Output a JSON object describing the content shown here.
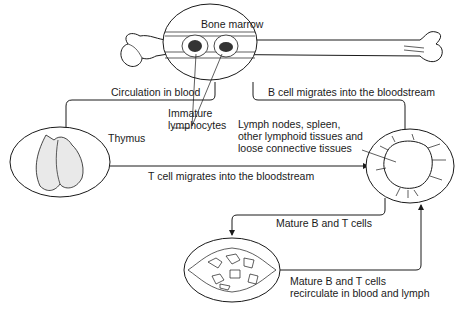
{
  "diagram": {
    "nodes": {
      "bone_marrow": {
        "label": "Bone marrow"
      },
      "thymus": {
        "label": "Thymus"
      },
      "lymph_tissues": {
        "label_lines": [
          "Lymph nodes, spleen,",
          "other lymphoid tissues and",
          "loose connective tissues"
        ]
      },
      "immature": {
        "label_lines": [
          "Immature",
          "lymphocytes"
        ]
      }
    },
    "edges": {
      "circulation": {
        "label": "Circulation in blood",
        "from": "bone_marrow",
        "to": "thymus"
      },
      "b_cell": {
        "label": "B cell migrates into the bloodstream",
        "from": "bone_marrow",
        "to": "lymph_tissues"
      },
      "t_cell": {
        "label": "T cell migrates into the bloodstream",
        "from": "thymus",
        "to": "lymph_tissues"
      },
      "mature": {
        "label": "Mature B and T cells",
        "from": "lymph_tissues",
        "to": "lymph_vessel"
      },
      "recirculate": {
        "label_lines": [
          "Mature B and T cells",
          "recirculate in blood and lymph"
        ],
        "from": "lymph_vessel",
        "to": "lymph_tissues"
      }
    },
    "colors": {
      "ink": "#1a1a1a",
      "background": "#ffffff",
      "shade": "#9a9a9a"
    }
  }
}
